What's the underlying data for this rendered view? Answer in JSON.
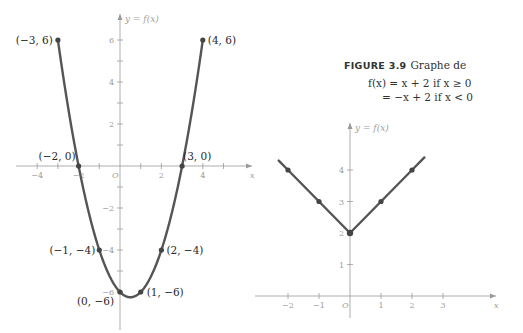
{
  "caption": {
    "figure_label": "FIGURE 3.9",
    "text": "Graphe de",
    "equation_line1": "f(x) = x + 2    if x ≥ 0",
    "equation_line2": "= −x + 2    if x < 0"
  },
  "chart_data": [
    {
      "type": "line",
      "title": "",
      "xlabel": "x",
      "ylabel": "y = f(x)",
      "xlim": [
        -4.2,
        5.3
      ],
      "ylim": [
        -6.5,
        6.5
      ],
      "x_ticks": [
        -4,
        -2,
        2,
        4
      ],
      "y_ticks": [
        6,
        4,
        2,
        -2,
        -4,
        -6
      ],
      "x_tick_labels": [
        "−4",
        "−2",
        "2",
        "4"
      ],
      "y_tick_labels": [
        "6",
        "4",
        "2",
        "−2",
        "−4",
        "−6"
      ],
      "origin_label": "O",
      "grid": false,
      "description": "Parabola y = x² − x − 6 on [−3, 4]",
      "series": [
        {
          "name": "f(x)",
          "x": [
            -3,
            -2,
            -1,
            0,
            0.5,
            1,
            2,
            3,
            4
          ],
          "y": [
            6,
            0,
            -4,
            -6,
            -6.25,
            -6,
            -4,
            0,
            6
          ]
        }
      ],
      "annotations": [
        {
          "x": -3,
          "y": 6,
          "label": "(−3, 6)"
        },
        {
          "x": 4,
          "y": 6,
          "label": "(4, 6)"
        },
        {
          "x": -2,
          "y": 0,
          "label": "(−2, 0)"
        },
        {
          "x": 3,
          "y": 0,
          "label": "(3, 0)"
        },
        {
          "x": -1,
          "y": -4,
          "label": "(−1, −4)"
        },
        {
          "x": 2,
          "y": -4,
          "label": "(2, −4)"
        },
        {
          "x": 0,
          "y": -6,
          "label": "(0, −6)"
        },
        {
          "x": 1,
          "y": -6,
          "label": "(1, −6)"
        }
      ]
    },
    {
      "type": "line",
      "title": "Graphe de f(x) = x + 2 if x ≥ 0; = −x + 2 if x < 0",
      "xlabel": "x",
      "ylabel": "y = f(x)",
      "xlim": [
        -2.6,
        3.8
      ],
      "ylim": [
        -0.5,
        4.8
      ],
      "x_ticks": [
        -2,
        -1,
        1,
        2,
        3
      ],
      "y_ticks": [
        1,
        2,
        3,
        4
      ],
      "x_tick_labels": [
        "−2",
        "−1",
        "1",
        "2",
        "3"
      ],
      "y_tick_labels": [
        "1",
        "2",
        "3",
        "4"
      ],
      "origin_label": "O",
      "grid": false,
      "series": [
        {
          "name": "f(x)",
          "x": [
            -2.3,
            -2,
            -1,
            0,
            1,
            2,
            2.4
          ],
          "y": [
            4.3,
            4,
            3,
            2,
            3,
            4,
            4.4
          ]
        }
      ],
      "marked_points": [
        {
          "x": -2,
          "y": 4
        },
        {
          "x": -1,
          "y": 3
        },
        {
          "x": 0,
          "y": 2
        },
        {
          "x": 1,
          "y": 3
        },
        {
          "x": 2,
          "y": 4
        }
      ]
    }
  ]
}
